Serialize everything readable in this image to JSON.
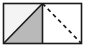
{
  "figure": {
    "background_color": "#ffffff",
    "outline_color": "#1a1a1a",
    "outline_width": 1.6,
    "bounds": {
      "x": 3.5,
      "y": 3.5,
      "width": 78,
      "height": 40
    },
    "divider": {
      "name": "vertical-midline",
      "x": 42.5,
      "y_top": 3.5,
      "y_bottom": 43.5,
      "color": "#1a1a1a",
      "width": 1.6,
      "style": "solid"
    },
    "left_square": {
      "name": "left-square",
      "x": 3.5,
      "y": 3.5,
      "width": 39,
      "height": 40,
      "fill_upper": "#f4f4f4",
      "fill_lower": "#b9b9b9",
      "diagonal": {
        "name": "solid-diagonal",
        "from": [
          3.5,
          43.5
        ],
        "to": [
          42.5,
          3.5
        ],
        "style": "solid",
        "color": "#1a1a1a",
        "width": 1.6
      }
    },
    "right_square": {
      "name": "right-square",
      "x": 42.5,
      "y": 3.5,
      "width": 39,
      "height": 40,
      "fill": "#ffffff",
      "diagonal": {
        "name": "dashed-diagonal",
        "from": [
          42.5,
          3.5
        ],
        "to": [
          81.5,
          43.5
        ],
        "style": "dashed",
        "color": "#1a1a1a",
        "width": 1.7,
        "dash_pattern": "4 3.5",
        "dash_count": 6
      }
    }
  }
}
